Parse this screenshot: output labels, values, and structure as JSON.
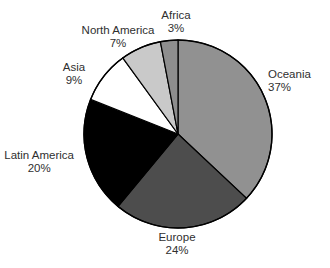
{
  "chart_data": {
    "type": "pie",
    "title": "",
    "categories": [
      "Oceania",
      "Europe",
      "Latin America",
      "Asia",
      "North America",
      "Africa"
    ],
    "values": [
      37,
      24,
      20,
      9,
      7,
      3
    ],
    "unit": "%",
    "legend": "none",
    "start_angle_deg": 0,
    "direction": "clockwise",
    "slices": [
      {
        "label": "Oceania",
        "percent": "37%",
        "value": 37,
        "color": "#919191"
      },
      {
        "label": "Europe",
        "percent": "24%",
        "value": 24,
        "color": "#4d4d4d"
      },
      {
        "label": "Latin America",
        "percent": "20%",
        "value": 20,
        "color": "#000000"
      },
      {
        "label": "Asia",
        "percent": "9%",
        "value": 9,
        "color": "#ffffff"
      },
      {
        "label": "North America",
        "percent": "7%",
        "value": 7,
        "color": "#c9c9c9"
      },
      {
        "label": "Africa",
        "percent": "3%",
        "value": 3,
        "color": "#8e8e8e"
      }
    ]
  },
  "labels": {
    "oceania": {
      "name": "Oceania",
      "pct": "37%"
    },
    "europe": {
      "name": "Europe",
      "pct": "24%"
    },
    "latin_america": {
      "name": "Latin America",
      "pct": "20%"
    },
    "asia": {
      "name": "Asia",
      "pct": "9%"
    },
    "north_america": {
      "name": "North America",
      "pct": "7%"
    },
    "africa": {
      "name": "Africa",
      "pct": "3%"
    }
  },
  "colors": {
    "background": "#ffffff",
    "outline": "#000000",
    "text": "#2f2f2f"
  }
}
